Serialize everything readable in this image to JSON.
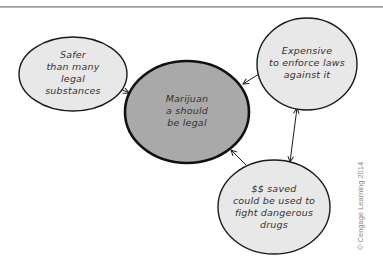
{
  "diagram": {
    "type": "concept-map",
    "colors": {
      "center_fill": "#a9a9a9",
      "satellite_fill": "#e8e8e8",
      "stroke": "#1a1a1a",
      "rule": "#9a9a9a",
      "copyright": "#888888"
    },
    "nodes": {
      "center": {
        "id": "marijuana-legal",
        "lines": [
          "Marijuan",
          "a should",
          "be legal"
        ]
      },
      "left": {
        "id": "safer",
        "lines": [
          "Safer",
          "than many",
          "legal",
          "substances"
        ]
      },
      "top_right": {
        "id": "expensive",
        "lines": [
          "Expensive",
          "to enforce laws",
          "against it"
        ]
      },
      "bottom_right": {
        "id": "money-saved",
        "lines": [
          "$$ saved",
          "could be used to",
          "fight dangerous",
          "drugs"
        ]
      }
    },
    "edges": [
      {
        "from": "safer",
        "to": "marijuana-legal",
        "direction": "forward"
      },
      {
        "from": "expensive",
        "to": "marijuana-legal",
        "direction": "forward"
      },
      {
        "from": "money-saved",
        "to": "marijuana-legal",
        "direction": "forward"
      },
      {
        "from": "expensive",
        "to": "money-saved",
        "direction": "both"
      }
    ],
    "copyright": "© Cengage Learning 2014"
  }
}
